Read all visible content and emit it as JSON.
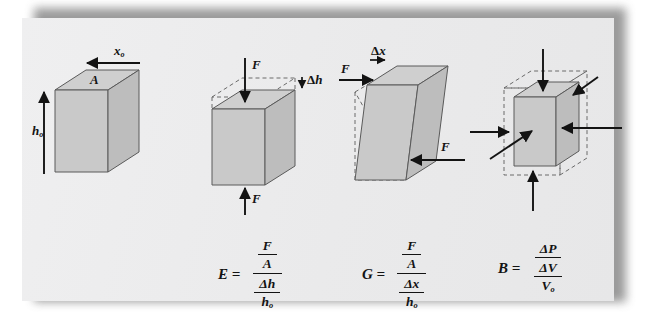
{
  "page": {
    "background_color": "#ffffff",
    "sheet_color": "#ececec",
    "ink_color": "#131313",
    "block_face_colors": {
      "top": "#cfcfcf",
      "front": "#c9c9c9",
      "side": "#bdbdbd",
      "outline": "#555555",
      "dashed_outline": "#6a6a6a"
    }
  },
  "figures": [
    {
      "id": "undeformed-block",
      "caption_labels": [
        {
          "name": "width-label",
          "text": "x",
          "subscript": "o"
        },
        {
          "name": "area-label",
          "text": "A",
          "subscript": ""
        },
        {
          "name": "height-label",
          "text": "h",
          "subscript": "o"
        }
      ],
      "arrows": [
        "width-arrow-left",
        "height-arrow-up"
      ]
    },
    {
      "id": "compression-block",
      "caption_labels": [
        {
          "name": "force-top-label",
          "text": "F",
          "subscript": ""
        },
        {
          "name": "delta-h-label",
          "text": "Δh",
          "subscript": ""
        },
        {
          "name": "force-bottom-label",
          "text": "F",
          "subscript": ""
        }
      ],
      "arrows": [
        "force-down-arrow",
        "delta-h-arrow",
        "force-up-arrow"
      ]
    },
    {
      "id": "shear-block",
      "caption_labels": [
        {
          "name": "delta-x-label",
          "text": "Δx",
          "subscript": ""
        },
        {
          "name": "force-left-label",
          "text": "F",
          "subscript": ""
        },
        {
          "name": "force-right-label",
          "text": "F",
          "subscript": ""
        }
      ],
      "arrows": [
        "force-right-arrow",
        "delta-x-arrow",
        "force-left-arrow"
      ]
    },
    {
      "id": "bulk-block",
      "caption_labels": [],
      "arrows": [
        "pressure-arrow-top",
        "pressure-arrow-bottom",
        "pressure-arrow-left",
        "pressure-arrow-right",
        "pressure-arrow-diagonal-front",
        "pressure-arrow-diagonal-back"
      ]
    }
  ],
  "formulas": [
    {
      "id": "youngs-modulus",
      "symbol": "E",
      "equals": "=",
      "numerator": {
        "num": "F",
        "den": "A"
      },
      "denominator": {
        "num": "Δh",
        "den": "h",
        "den_sub": "o"
      }
    },
    {
      "id": "shear-modulus",
      "symbol": "G",
      "equals": "=",
      "numerator": {
        "num": "F",
        "den": "A"
      },
      "denominator": {
        "num": "Δx",
        "den": "h",
        "den_sub": "o"
      }
    },
    {
      "id": "bulk-modulus",
      "symbol": "B",
      "equals": "=",
      "numerator_plain": "ΔP",
      "denominator": {
        "num": "ΔV",
        "den": "V",
        "den_sub": "o"
      }
    }
  ]
}
